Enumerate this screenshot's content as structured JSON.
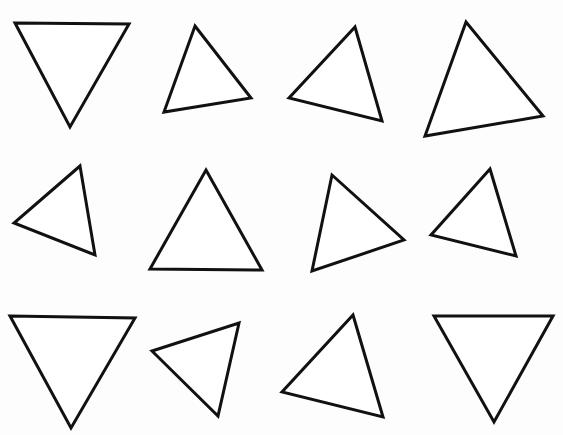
{
  "canvas": {
    "width": 563,
    "height": 435,
    "background": "#fdfdfd",
    "stroke": "#111111",
    "fill": "#ffffff",
    "stroke_width": 3
  },
  "triangles": [
    {
      "id": 1,
      "points": "15,23 129,24 70,127"
    },
    {
      "id": 2,
      "points": "195,26 251,98 164,112"
    },
    {
      "id": 3,
      "points": "355,27 382,121 289,98"
    },
    {
      "id": 4,
      "points": "466,22 543,116 425,136"
    },
    {
      "id": 5,
      "points": "80,166 95,255 14,223"
    },
    {
      "id": 6,
      "points": "206,170 262,270 150,269"
    },
    {
      "id": 7,
      "points": "332,175 404,240 312,271"
    },
    {
      "id": 8,
      "points": "490,169 516,256 431,235"
    },
    {
      "id": 9,
      "points": "10,316 135,318 71,428"
    },
    {
      "id": 10,
      "points": "152,351 239,323 218,416"
    },
    {
      "id": 11,
      "points": "353,315 383,417 282,392"
    },
    {
      "id": 12,
      "points": "434,316 553,316 494,422"
    }
  ]
}
